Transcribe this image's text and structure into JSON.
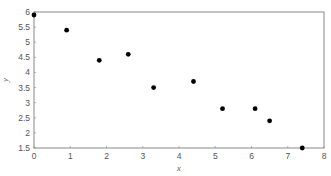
{
  "chart_data": {
    "type": "scatter",
    "title": "",
    "xlabel": "x",
    "ylabel": "y",
    "xlim": [
      0,
      8
    ],
    "ylim": [
      1.5,
      6
    ],
    "xticks": [
      0,
      1,
      2,
      3,
      4,
      5,
      6,
      7,
      8
    ],
    "yticks": [
      1.5,
      2,
      2.5,
      3,
      3.5,
      4,
      4.5,
      5,
      5.5,
      6
    ],
    "grid": false,
    "legend": null,
    "series": [
      {
        "name": "data",
        "color": "#000000",
        "x": [
          0,
          0.9,
          1.8,
          2.6,
          3.3,
          4.4,
          5.2,
          6.1,
          6.5,
          7.4
        ],
        "y": [
          5.9,
          5.4,
          4.4,
          4.6,
          3.5,
          3.7,
          2.8,
          2.8,
          2.4,
          1.5
        ]
      }
    ]
  },
  "layout": {
    "plot_left": 34,
    "plot_right": 324,
    "plot_top": 12,
    "plot_bottom": 148,
    "axis_color": "#888888"
  }
}
